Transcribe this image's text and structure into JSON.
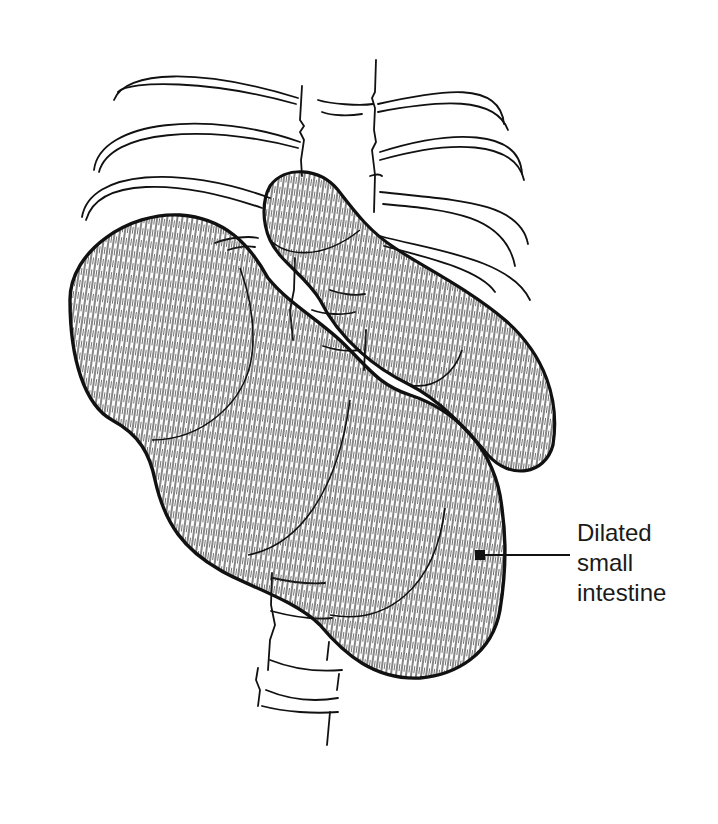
{
  "figure": {
    "elements": [
      "ribs",
      "vertebral-column",
      "upper-bowel-loop",
      "lower-bowel-loop",
      "label-arrow"
    ]
  },
  "annotation": {
    "lines": [
      "Dilated",
      "small",
      "intestine"
    ]
  },
  "colors": {
    "ink": "#111111",
    "background": "#ffffff"
  }
}
